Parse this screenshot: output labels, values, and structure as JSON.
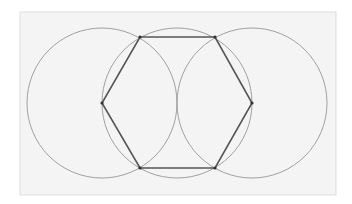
{
  "diagram": {
    "panel": {
      "x": 20,
      "y": 12,
      "width": 316,
      "height": 183,
      "fill": "#f4f4f4",
      "stroke": "#dddddd"
    },
    "circles": [
      {
        "cx": 102,
        "cy": 103,
        "r": 75
      },
      {
        "cx": 177,
        "cy": 103,
        "r": 75
      },
      {
        "cx": 252,
        "cy": 103,
        "r": 75
      }
    ],
    "circle_color": "#8a8a8a",
    "hexagon": {
      "points": "140,37 215,37 252,103 215,168 140,168 102,103",
      "color": "#555555"
    },
    "vertices": [
      {
        "x": 140,
        "y": 37
      },
      {
        "x": 215,
        "y": 37
      },
      {
        "x": 252,
        "y": 103
      },
      {
        "x": 215,
        "y": 168
      },
      {
        "x": 140,
        "y": 168
      },
      {
        "x": 102,
        "y": 103
      }
    ]
  }
}
